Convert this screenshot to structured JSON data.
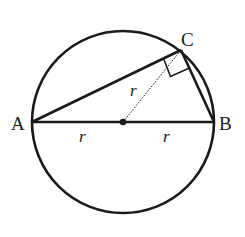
{
  "diagram": {
    "type": "geometry",
    "colors": {
      "stroke": "#1a1a1a",
      "background": "#ffffff"
    },
    "circle": {
      "cx": 123,
      "cy": 122,
      "r": 91
    },
    "points": {
      "A": {
        "label": "A",
        "x": 32,
        "y": 122
      },
      "B": {
        "label": "B",
        "x": 214,
        "y": 122
      },
      "C": {
        "label": "C",
        "x": 181,
        "y": 50
      },
      "O": {
        "label": "",
        "x": 123,
        "y": 122
      }
    },
    "segment_labels": {
      "AO": "r",
      "OB": "r",
      "OC": "r"
    },
    "right_angle_at": "C"
  }
}
